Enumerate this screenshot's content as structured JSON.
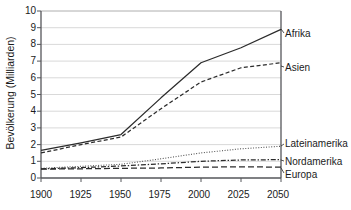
{
  "chart_data": {
    "type": "line",
    "title": "",
    "xlabel": "",
    "ylabel": "Bevölkerung (Milliarden)",
    "xlim": [
      1900,
      2050
    ],
    "ylim": [
      0,
      10
    ],
    "grid": true,
    "legend_position": "right-inline",
    "xticks": [
      "1900",
      "1925",
      "1950",
      "1975",
      "2000",
      "2025",
      "2050"
    ],
    "yticks": [
      "0",
      "1",
      "2",
      "3",
      "4",
      "5",
      "6",
      "7",
      "8",
      "9",
      "10"
    ],
    "x": [
      1900,
      1925,
      1950,
      1975,
      2000,
      2025,
      2050
    ],
    "series": [
      {
        "name": "Afrika",
        "style": "solid",
        "color": "#2b2b2b",
        "values": [
          1.65,
          2.1,
          2.6,
          4.8,
          6.9,
          7.8,
          8.9
        ]
      },
      {
        "name": "Asien",
        "style": "dashed",
        "color": "#2b2b2b",
        "values": [
          1.5,
          2.0,
          2.45,
          4.15,
          5.75,
          6.6,
          6.9
        ]
      },
      {
        "name": "Lateinamerika",
        "style": "dotted",
        "color": "#555555",
        "values": [
          0.58,
          0.7,
          0.82,
          1.15,
          1.5,
          1.75,
          1.9
        ]
      },
      {
        "name": "Nordamerika",
        "style": "dashdot",
        "color": "#2b2b2b",
        "values": [
          0.55,
          0.62,
          0.72,
          0.85,
          1.0,
          1.08,
          1.1
        ]
      },
      {
        "name": "Europa",
        "style": "dashed-long",
        "color": "#2b2b2b",
        "values": [
          0.53,
          0.55,
          0.58,
          0.6,
          0.65,
          0.67,
          0.65
        ]
      }
    ]
  },
  "axis": {
    "y_title": "Bevölkerung (Milliarden)"
  },
  "ylabels": {
    "t10": "10",
    "t9": "9",
    "t8": "8",
    "t7": "7",
    "t6": "6",
    "t5": "5",
    "t4": "4",
    "t3": "3",
    "t2": "2",
    "t1": "1",
    "t0": "0"
  },
  "xlabels": {
    "t1900": "1900",
    "t1925": "1925",
    "t1950": "1950",
    "t1975": "1975",
    "t2000": "2000",
    "t2025": "2025",
    "t2050": "2050"
  },
  "legend": {
    "afrika": "Afrika",
    "asien": "Asien",
    "lateinamerika": "Lateinamerika",
    "nordamerika": "Nordamerika",
    "europa": "Europa"
  }
}
